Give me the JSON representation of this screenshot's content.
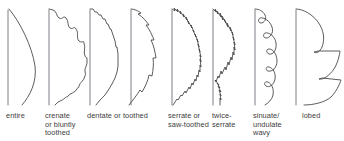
{
  "figure": {
    "background_color": "#ffffff",
    "line_color": "#4a4a4a",
    "text_color": "#3d3d3d",
    "width": 344,
    "height": 141
  },
  "leaves": [
    {
      "id": "entire",
      "label": "entire",
      "margin_type": "entire",
      "midrib_x": 8,
      "label_x": 6,
      "label_y": 112
    },
    {
      "id": "crenate",
      "label": "crenate\nor bluntly\ntoothed",
      "margin_type": "crenate",
      "midrib_x": 49,
      "label_x": 45,
      "label_y": 112
    },
    {
      "id": "dentate",
      "label": "dentate  or toothed",
      "margin_type": "dentate",
      "midrib_x": 90,
      "label_x": 87,
      "label_y": 112
    },
    {
      "id": "dentate-2",
      "label": "",
      "margin_type": "dentate",
      "midrib_x": 131,
      "label_x": 131,
      "label_y": 112
    },
    {
      "id": "serrate",
      "label": "serrate or\nsaw-toothed",
      "margin_type": "serrate",
      "midrib_x": 172,
      "label_x": 168,
      "label_y": 112
    },
    {
      "id": "twice-serrate",
      "label": "twice-\nserrate",
      "margin_type": "twice-serrate",
      "midrib_x": 213,
      "label_x": 212,
      "label_y": 112
    },
    {
      "id": "sinuate-undulate",
      "label": "sinuate/\nundulate\nwavy",
      "margin_type": "sinuate",
      "midrib_x": 255,
      "label_x": 253,
      "label_y": 112
    },
    {
      "id": "lobed",
      "label": "lobed",
      "margin_type": "lobed",
      "midrib_x": 296,
      "label_x": 302,
      "label_y": 112
    }
  ]
}
